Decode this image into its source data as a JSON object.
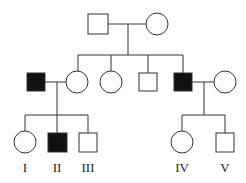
{
  "diagram": {
    "type": "pedigree",
    "legend_none": true,
    "colors": {
      "affected": "#111111",
      "unaffected": "#ffffff",
      "line": "#333333"
    },
    "generation3_labels": [
      "I",
      "II",
      "III",
      "IV",
      "V"
    ],
    "individuals": [
      {
        "id": "g1-father",
        "sex": "male",
        "affected": false
      },
      {
        "id": "g1-mother",
        "sex": "female",
        "affected": false
      },
      {
        "id": "g2-husband-left",
        "sex": "male",
        "affected": true
      },
      {
        "id": "g2-daughter-1",
        "sex": "female",
        "affected": false
      },
      {
        "id": "g2-daughter-2",
        "sex": "female",
        "affected": false
      },
      {
        "id": "g2-son-1",
        "sex": "male",
        "affected": false
      },
      {
        "id": "g2-son-2",
        "sex": "male",
        "affected": true
      },
      {
        "id": "g2-wife-right",
        "sex": "female",
        "affected": false
      },
      {
        "id": "I",
        "sex": "female",
        "affected": false
      },
      {
        "id": "II",
        "sex": "male",
        "affected": true
      },
      {
        "id": "III",
        "sex": "male",
        "affected": false
      },
      {
        "id": "IV",
        "sex": "female",
        "affected": false
      },
      {
        "id": "V",
        "sex": "male",
        "affected": false
      }
    ]
  }
}
